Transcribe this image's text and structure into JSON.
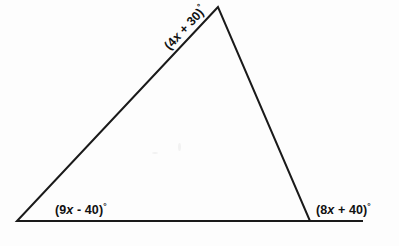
{
  "figure": {
    "kind": "triangle-angle-diagram",
    "background_color": "#fdfdfd",
    "stroke_color": "#1a1a1a",
    "stroke_width": 2,
    "width": 399,
    "height": 246
  },
  "shape": {
    "name": "triangle",
    "vertices": [
      {
        "id": "apex",
        "x": 218,
        "y": 7
      },
      {
        "id": "bottom-left",
        "x": 17,
        "y": 221
      },
      {
        "id": "bottom-right",
        "x": 310,
        "y": 221
      }
    ],
    "base_extension": {
      "from_x": 310,
      "to_x": 362,
      "y": 221
    },
    "points_attr": "218,7 17,221 310,221"
  },
  "labels": {
    "apex": {
      "full_text": "(4x + 30)°",
      "prefix": "(4",
      "variable": "x",
      "suffix": " + 30)",
      "degree": "°",
      "rotation_deg": -47
    },
    "bottom_left": {
      "full_text": "(9x - 40)°",
      "prefix": "(9",
      "variable": "x",
      "suffix": " - 40)",
      "degree": "°",
      "rotation_deg": 0
    },
    "bottom_right": {
      "full_text": "(8x + 40)°",
      "prefix": "(8",
      "variable": "x",
      "suffix": " + 40)",
      "degree": "°",
      "rotation_deg": 0
    }
  }
}
